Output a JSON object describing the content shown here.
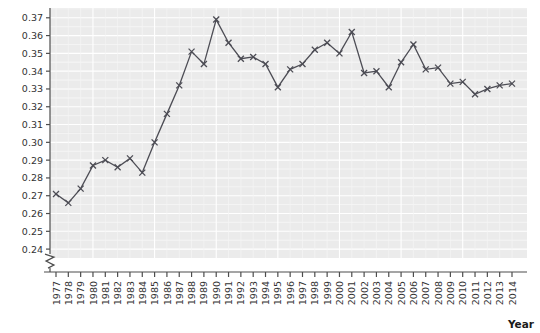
{
  "chart_data": {
    "type": "line",
    "title": "",
    "xlabel": "Year",
    "ylabel": "Gini coefficient",
    "x": [
      1977,
      1978,
      1979,
      1980,
      1981,
      1982,
      1983,
      1984,
      1985,
      1986,
      1987,
      1988,
      1989,
      1990,
      1991,
      1992,
      1993,
      1994,
      1995,
      1996,
      1997,
      1998,
      1999,
      2000,
      2001,
      2002,
      2003,
      2004,
      2005,
      2006,
      2007,
      2008,
      2009,
      2010,
      2011,
      2012,
      2013,
      2014
    ],
    "categories": [
      "1977",
      "1978",
      "1979",
      "1980",
      "1981",
      "1982",
      "1983",
      "1984",
      "1985",
      "1986",
      "1987",
      "1988",
      "1989",
      "1990",
      "1991",
      "1992",
      "1993",
      "1994",
      "1995",
      "1996",
      "1997",
      "1998",
      "1999",
      "2000",
      "2001",
      "2002",
      "2003",
      "2004",
      "2005",
      "2006",
      "2007",
      "2008",
      "2009",
      "2010",
      "2011",
      "2012",
      "2013",
      "2014"
    ],
    "values": [
      0.271,
      0.266,
      0.274,
      0.287,
      0.29,
      0.286,
      0.291,
      0.283,
      0.3,
      0.316,
      0.332,
      0.351,
      0.344,
      0.369,
      0.356,
      0.347,
      0.348,
      0.344,
      0.331,
      0.341,
      0.344,
      0.352,
      0.356,
      0.35,
      0.362,
      0.339,
      0.34,
      0.331,
      0.345,
      0.355,
      0.341,
      0.342,
      0.333,
      0.334,
      0.327,
      0.33,
      0.332,
      0.333
    ],
    "series": [
      {
        "name": "Gini coefficient",
        "values": [
          0.271,
          0.266,
          0.274,
          0.287,
          0.29,
          0.286,
          0.291,
          0.283,
          0.3,
          0.316,
          0.332,
          0.351,
          0.344,
          0.369,
          0.356,
          0.347,
          0.348,
          0.344,
          0.331,
          0.341,
          0.344,
          0.352,
          0.356,
          0.35,
          0.362,
          0.339,
          0.34,
          0.331,
          0.345,
          0.355,
          0.341,
          0.342,
          0.333,
          0.334,
          0.327,
          0.33,
          0.332,
          0.333
        ],
        "color": "#4d4d55",
        "marker": "x",
        "line_style": "solid"
      }
    ],
    "ylim": [
      0.235,
      0.3755
    ],
    "yticks": [
      0.24,
      0.25,
      0.26,
      0.27,
      0.28,
      0.29,
      0.3,
      0.31,
      0.32,
      0.33,
      0.34,
      0.35,
      0.36,
      0.37
    ],
    "ytick_labels": [
      "0.24",
      "0.25",
      "0.26",
      "0.27",
      "0.28",
      "0.29",
      "0.30",
      "0.31",
      "0.32",
      "0.33",
      "0.34",
      "0.35",
      "0.36",
      "0.37"
    ],
    "xtick_labels": [
      "1977",
      "1978",
      "1979",
      "1980",
      "1981",
      "1982",
      "1983",
      "1984",
      "1985",
      "1986",
      "1987",
      "1988",
      "1989",
      "1990",
      "1991",
      "1992",
      "1993",
      "1994",
      "1995",
      "1996",
      "1997",
      "1998",
      "1999",
      "2000",
      "2001",
      "2002",
      "2003",
      "2004",
      "2005",
      "2006",
      "2007",
      "2008",
      "2009",
      "2010",
      "2011",
      "2012",
      "2013",
      "2014"
    ],
    "grid": true,
    "grid_color": "#ffffff",
    "plot_background": "#ebebeb",
    "figure_background": "#ffffff",
    "axis_color": "#4d4d4d",
    "legend": null,
    "legend_position": "none",
    "axis_break": {
      "axis": "y",
      "symbol": "zigzag",
      "below_value": "0.24"
    },
    "annotations": []
  }
}
